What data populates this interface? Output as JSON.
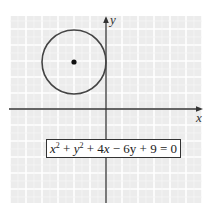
{
  "chart_data": {
    "type": "line",
    "title": "",
    "xlabel": "x",
    "ylabel": "y",
    "xlim": [
      -6,
      6
    ],
    "ylim": [
      -6,
      6
    ],
    "grid": true,
    "grid_step": 1,
    "tick_labels": false,
    "equation": {
      "parts": [
        {
          "t": "x",
          "i": true
        },
        {
          "t": "2",
          "sup": true
        },
        {
          "t": " + "
        },
        {
          "t": "y",
          "i": true
        },
        {
          "t": "2",
          "sup": true
        },
        {
          "t": " + 4"
        },
        {
          "t": "x",
          "i": true
        },
        {
          "t": " − 6y + 9 = 0"
        }
      ],
      "text": "x² + y² + 4x − 6y + 9 = 0",
      "position": "bottom-center"
    },
    "circle": {
      "center": [
        -2,
        3
      ],
      "radius": 2,
      "center_marked": true
    },
    "colors": {
      "background_cell": "#ececec",
      "grid_line": "#ffffff",
      "axis": "#333333",
      "curve": "#444444",
      "center_point": "#111111"
    }
  }
}
